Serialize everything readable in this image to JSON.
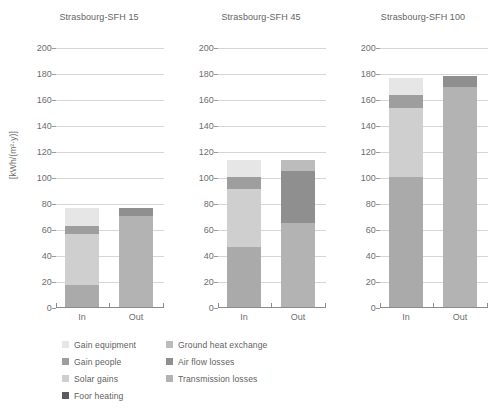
{
  "axis": {
    "ylabel": "[kWh/(m²·y)]",
    "yticks": [
      0,
      20,
      40,
      60,
      80,
      100,
      120,
      140,
      160,
      180,
      200
    ],
    "ymin": 0,
    "ymax": 200,
    "xticks": [
      "In",
      "Out"
    ]
  },
  "colors": {
    "gain_equipment": "#e6e6e6",
    "gain_people": "#9e9e9e",
    "solar_gains": "#cfcfcf",
    "floor_heating": "#5c5c5c",
    "ground_heat_exchange": "#bcbcbc",
    "air_flow_losses": "#8f8f8f",
    "transmission_losses": "#b3b3b3",
    "grid": "#d6d6d6",
    "axis": "#8c8c8c",
    "text": "#5f5f5f",
    "background": "#ffffff"
  },
  "legend": {
    "columns": [
      [
        {
          "label": "Gain equipment",
          "key": "gain_equipment"
        },
        {
          "label": "Gain people",
          "key": "gain_people"
        },
        {
          "label": "Solar gains",
          "key": "solar_gains"
        },
        {
          "label": "Foor heating",
          "key": "floor_heating"
        }
      ],
      [
        {
          "label": "Ground heat exchange",
          "key": "ground_heat_exchange"
        },
        {
          "label": "Air flow losses",
          "key": "air_flow_losses"
        },
        {
          "label": "Transmission losses",
          "key": "transmission_losses"
        }
      ]
    ]
  },
  "panels": [
    {
      "title": "Strasbourg-SFH 15"
    },
    {
      "title": "Strasbourg-SFH 45"
    },
    {
      "title": "Strasbourg-SFH 100"
    }
  ],
  "chart_data": {
    "type": "bar",
    "subtype": "stacked",
    "title": "",
    "xlabel": "",
    "ylabel": "[kWh/(m²·y)]",
    "ylim": [
      0,
      200
    ],
    "ytick_step": 20,
    "grid": true,
    "legend_position": "bottom",
    "categories": [
      "In",
      "Out"
    ],
    "panels": [
      {
        "title": "Strasbourg-SFH 15",
        "bars": [
          {
            "category": "In",
            "total": 76,
            "segments": [
              {
                "name": "Foor heating",
                "value": 17
              },
              {
                "name": "Solar gains",
                "value": 39
              },
              {
                "name": "Gain people",
                "value": 6
              },
              {
                "name": "Gain equipment",
                "value": 14
              }
            ]
          },
          {
            "category": "Out",
            "total": 76,
            "segments": [
              {
                "name": "Transmission losses",
                "value": 70
              },
              {
                "name": "Air flow losses",
                "value": 6
              }
            ]
          }
        ]
      },
      {
        "title": "Strasbourg-SFH 45",
        "bars": [
          {
            "category": "In",
            "total": 113,
            "segments": [
              {
                "name": "Foor heating",
                "value": 46
              },
              {
                "name": "Solar gains",
                "value": 45
              },
              {
                "name": "Gain people",
                "value": 9
              },
              {
                "name": "Gain equipment",
                "value": 13
              }
            ]
          },
          {
            "category": "Out",
            "total": 113,
            "segments": [
              {
                "name": "Transmission losses",
                "value": 65
              },
              {
                "name": "Air flow losses",
                "value": 40
              },
              {
                "name": "Ground heat exchange",
                "value": 8
              }
            ]
          }
        ]
      },
      {
        "title": "Strasbourg-SFH 100",
        "bars": [
          {
            "category": "In",
            "total": 176,
            "segments": [
              {
                "name": "Foor heating",
                "value": 100
              },
              {
                "name": "Solar gains",
                "value": 53
              },
              {
                "name": "Gain people",
                "value": 10
              },
              {
                "name": "Gain equipment",
                "value": 13
              }
            ]
          },
          {
            "category": "Out",
            "total": 178,
            "segments": [
              {
                "name": "Transmission losses",
                "value": 169
              },
              {
                "name": "Air flow losses",
                "value": 9
              }
            ]
          }
        ]
      }
    ]
  }
}
